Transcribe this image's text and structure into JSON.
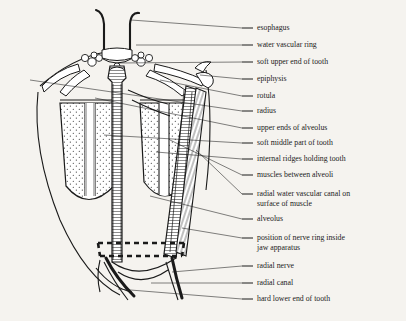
{
  "figure": {
    "background_color": "#f5f3ef",
    "ink_color": "#1a1a1a",
    "label_font_size_px": 7.8
  },
  "labels": [
    {
      "id": "esophagus",
      "text": "esophagus",
      "text2": "",
      "y": 28,
      "dash_x1": 242,
      "dash_x2": 253,
      "leader_to_x": 131,
      "leader_to_y": 20
    },
    {
      "id": "water-vascular-ring",
      "text": "water vascular ring",
      "text2": "",
      "y": 45,
      "dash_x1": 242,
      "dash_x2": 253,
      "leader_to_x": 136,
      "leader_to_y": 45
    },
    {
      "id": "soft-upper-end-of-tooth",
      "text": "soft upper end of tooth",
      "text2": "",
      "y": 62,
      "dash_x1": 242,
      "dash_x2": 253,
      "leader_to_x": 118,
      "leader_to_y": 63
    },
    {
      "id": "epiphysis",
      "text": "epiphysis",
      "text2": "",
      "y": 79,
      "dash_x1": 242,
      "dash_x2": 253,
      "leader_to_x": 200,
      "leader_to_y": 75
    },
    {
      "id": "rotula",
      "text": "rotula",
      "text2": "",
      "y": 96,
      "dash_x1": 242,
      "dash_x2": 253,
      "leader_to_x": 160,
      "leader_to_y": 80
    },
    {
      "id": "radius",
      "text": "radius",
      "text2": "",
      "y": 111,
      "dash_x1": 242,
      "dash_x2": 253,
      "leader_to_x": 30,
      "leader_to_y": 80
    },
    {
      "id": "upper-ends-of-alveolus",
      "text": "upper ends of alveolus",
      "text2": "",
      "y": 128,
      "dash_x1": 242,
      "dash_x2": 253,
      "leader_to_x": 95,
      "leader_to_y": 98
    },
    {
      "id": "soft-middle-part-of-tooth",
      "text": "soft middle part of tooth",
      "text2": "",
      "y": 143,
      "dash_x1": 242,
      "dash_x2": 253,
      "leader_to_x": 104,
      "leader_to_y": 135
    },
    {
      "id": "internal-ridges-holding-tooth",
      "text": "internal ridges holding tooth",
      "text2": "",
      "y": 159,
      "dash_x1": 242,
      "dash_x2": 253,
      "leader_to_x": 156,
      "leader_to_y": 152
    },
    {
      "id": "muscles-between-alveoli",
      "text": "muscles between alveoli",
      "text2": "",
      "y": 175,
      "dash_x1": 242,
      "dash_x2": 253,
      "leader_to_x": 170,
      "leader_to_y": 140
    },
    {
      "id": "radial-water-vascular-canal",
      "text": "radial water vascular canal on",
      "text2": "surface of muscle",
      "y": 194,
      "dash_x1": 242,
      "dash_x2": 253,
      "leader_to_x": 196,
      "leader_to_y": 150
    },
    {
      "id": "alveolus",
      "text": "alveolus",
      "text2": "",
      "y": 219,
      "dash_x1": 242,
      "dash_x2": 253,
      "leader_to_x": 150,
      "leader_to_y": 196
    },
    {
      "id": "position-of-nerve-ring",
      "text": "position of nerve ring inside",
      "text2": "jaw apparatus",
      "y": 238,
      "dash_x1": 242,
      "dash_x2": 253,
      "leader_to_x": 182,
      "leader_to_y": 228
    },
    {
      "id": "radial-nerve",
      "text": "radial nerve",
      "text2": "",
      "y": 266,
      "dash_x1": 242,
      "dash_x2": 253,
      "leader_to_x": 172,
      "leader_to_y": 272
    },
    {
      "id": "radial-canal",
      "text": "radial canal",
      "text2": "",
      "y": 283,
      "dash_x1": 242,
      "dash_x2": 253,
      "leader_to_x": 151,
      "leader_to_y": 283
    },
    {
      "id": "hard-lower-end-of-tooth",
      "text": "hard lower end of tooth",
      "text2": "",
      "y": 299,
      "dash_x1": 242,
      "dash_x2": 253,
      "leader_to_x": 118,
      "leader_to_y": 289
    }
  ]
}
